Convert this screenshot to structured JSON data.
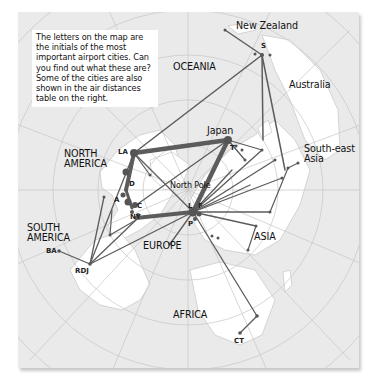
{
  "info_text": "The letters on the map are the initials of the most important airport cities. Can you find out what these are? Some of the cities are also shown in the air distances table on the right.",
  "regions": {
    "new_zealand": "New Zealand",
    "oceania": "OCEANIA",
    "australia": "Australia",
    "japan": "Japan",
    "southeast_asia_1": "South-east",
    "southeast_asia_2": "Asia",
    "north_america_1": "NORTH",
    "north_america_2": "AMERICA",
    "north_pole": "North Pole",
    "south_america_1": "SOUTH",
    "south_america_2": "AMERICA",
    "europe": "EUROPE",
    "asia": "ASIA",
    "africa": "AFRICA"
  },
  "cities": {
    "sydney": "S",
    "los_angeles": "LA",
    "denver": "D",
    "atlanta": "A",
    "chicago": "C",
    "new_york": "NY",
    "tokyo": "T",
    "london": "L",
    "frankfurt": "F",
    "paris": "P",
    "buenos_aires": "BA",
    "rio": "RDJ",
    "cape_town": "CT"
  },
  "colors": {
    "land": "#ffffff",
    "sea": "#ebebeb",
    "route": "#5a5a5a",
    "grid": "#c8c8c8"
  }
}
